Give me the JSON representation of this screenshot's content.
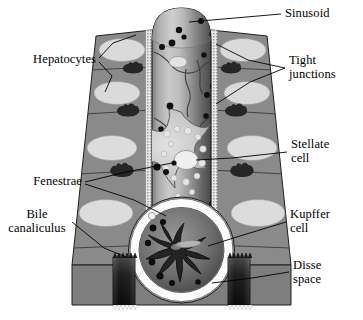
{
  "figure": {
    "background_color": "#ffffff",
    "line_color": "#000000"
  },
  "labels": {
    "sinusoid": "Sinusoid",
    "tight_junctions": "Tight\njunctions",
    "hepatocytes": "Hepatocytes",
    "stellate_cell": "Stellate\ncell",
    "fenestrae": "Fenestrae",
    "kupffer_cell": "Kupffer\ncell",
    "bile_canaliculus": "Bile\ncanaliculus",
    "disse_space": "Disse\nspace"
  },
  "colors": {
    "hepatocyte_plate": "#8a8a8a",
    "hepatocyte_plate_dark": "#6f6f6f",
    "hepatocyte_nucleus": "#d9d9d9",
    "sinusoid_light": "#d2d2d2",
    "sinusoid_mid": "#9a9a9a",
    "sinusoid_dark": "#4e4e4e",
    "stellate_cell": "#c9c9c9",
    "lipid_droplet": "#e6e6e6",
    "fenestra_dot": "#111111",
    "kupffer_cell": "#2b2b2b",
    "disse_space": "#fdfdfd",
    "bile_canaliculus": "#151515",
    "tight_junction": "#e2e2e2",
    "outline": "#1a1a1a"
  },
  "structures": {
    "hepatocyte_nuclei_left": 4,
    "hepatocyte_nuclei_right": 4,
    "bile_canaliculi_left": 3,
    "bile_canaliculi_right": 3,
    "fenestrae_dots": 18,
    "lipid_droplets": 14,
    "kupffer_arms": 9
  }
}
